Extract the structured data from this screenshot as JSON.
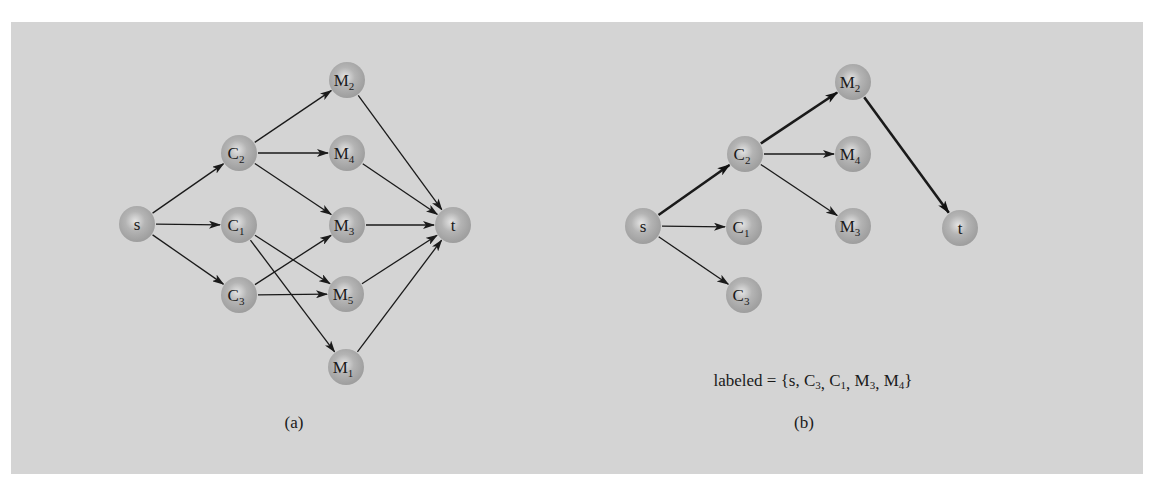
{
  "figure": {
    "background_color": "#d4d4d4",
    "node_color": "#a8a8a8",
    "edge_color": "#1a1a1a",
    "node_radius": 18
  },
  "panels": [
    {
      "id": "a",
      "caption": "(a)",
      "caption_pos": [
        294,
        428
      ],
      "nodes": [
        {
          "id": "s",
          "base": "s",
          "sub": "",
          "x": 137,
          "y": 224
        },
        {
          "id": "C2",
          "base": "C",
          "sub": "2",
          "x": 239,
          "y": 153
        },
        {
          "id": "C1",
          "base": "C",
          "sub": "1",
          "x": 239,
          "y": 225
        },
        {
          "id": "C3",
          "base": "C",
          "sub": "3",
          "x": 239,
          "y": 295
        },
        {
          "id": "M2",
          "base": "M",
          "sub": "2",
          "x": 347,
          "y": 80
        },
        {
          "id": "M4",
          "base": "M",
          "sub": "4",
          "x": 347,
          "y": 153
        },
        {
          "id": "M3",
          "base": "M",
          "sub": "3",
          "x": 347,
          "y": 225
        },
        {
          "id": "M5",
          "base": "M",
          "sub": "5",
          "x": 346,
          "y": 294
        },
        {
          "id": "M1",
          "base": "M",
          "sub": "1",
          "x": 346,
          "y": 367
        },
        {
          "id": "t",
          "base": "t",
          "sub": "",
          "x": 453,
          "y": 225
        }
      ],
      "edges": [
        {
          "from": "s",
          "to": "C2",
          "bold": false
        },
        {
          "from": "s",
          "to": "C1",
          "bold": false
        },
        {
          "from": "s",
          "to": "C3",
          "bold": false
        },
        {
          "from": "C2",
          "to": "M2",
          "bold": false
        },
        {
          "from": "C2",
          "to": "M4",
          "bold": false
        },
        {
          "from": "C2",
          "to": "M3",
          "bold": false
        },
        {
          "from": "C1",
          "to": "M5",
          "bold": false
        },
        {
          "from": "C1",
          "to": "M1",
          "bold": false
        },
        {
          "from": "C3",
          "to": "M3",
          "bold": false
        },
        {
          "from": "C3",
          "to": "M5",
          "bold": false
        },
        {
          "from": "M2",
          "to": "t",
          "bold": false
        },
        {
          "from": "M4",
          "to": "t",
          "bold": false
        },
        {
          "from": "M3",
          "to": "t",
          "bold": false
        },
        {
          "from": "M5",
          "to": "t",
          "bold": false
        },
        {
          "from": "M1",
          "to": "t",
          "bold": false
        }
      ]
    },
    {
      "id": "b",
      "caption": "(b)",
      "caption_pos": [
        804,
        428
      ],
      "annotation": {
        "prefix": "labeled = {s, ",
        "items": [
          {
            "base": "C",
            "sub": "3"
          },
          {
            "base": "C",
            "sub": "1"
          },
          {
            "base": "M",
            "sub": "3"
          },
          {
            "base": "M",
            "sub": "4"
          }
        ],
        "suffix": "}",
        "text": "labeled = {s, C3, C1, M3, M4}",
        "pos": [
          813,
          386
        ]
      },
      "nodes": [
        {
          "id": "s",
          "base": "s",
          "sub": "",
          "x": 643,
          "y": 226
        },
        {
          "id": "C2",
          "base": "C",
          "sub": "2",
          "x": 745,
          "y": 154
        },
        {
          "id": "C1",
          "base": "C",
          "sub": "1",
          "x": 744,
          "y": 227
        },
        {
          "id": "C3",
          "base": "C",
          "sub": "3",
          "x": 744,
          "y": 295
        },
        {
          "id": "M2",
          "base": "M",
          "sub": "2",
          "x": 853,
          "y": 82
        },
        {
          "id": "M4",
          "base": "M",
          "sub": "4",
          "x": 853,
          "y": 154
        },
        {
          "id": "M3",
          "base": "M",
          "sub": "3",
          "x": 853,
          "y": 226
        },
        {
          "id": "t",
          "base": "t",
          "sub": "",
          "x": 960,
          "y": 228
        }
      ],
      "edges": [
        {
          "from": "s",
          "to": "C2",
          "bold": true
        },
        {
          "from": "s",
          "to": "C1",
          "bold": false
        },
        {
          "from": "s",
          "to": "C3",
          "bold": false
        },
        {
          "from": "C2",
          "to": "M2",
          "bold": true
        },
        {
          "from": "C2",
          "to": "M4",
          "bold": false
        },
        {
          "from": "C2",
          "to": "M3",
          "bold": false
        },
        {
          "from": "M2",
          "to": "t",
          "bold": true
        }
      ]
    }
  ]
}
